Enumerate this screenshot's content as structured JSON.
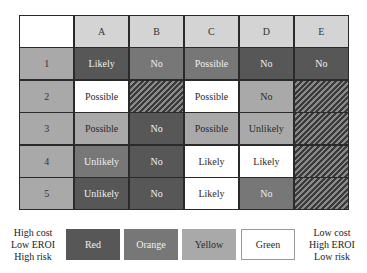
{
  "matrix": {
    "column_headers": [
      "A",
      "B",
      "C",
      "D",
      "E"
    ],
    "rows": [
      {
        "label": "1",
        "cells": [
          {
            "text": "Likely",
            "color": "red"
          },
          {
            "text": "No",
            "color": "orange"
          },
          {
            "text": "Possible",
            "color": "orange"
          },
          {
            "text": "No",
            "color": "red"
          },
          {
            "text": "No",
            "color": "red"
          }
        ]
      },
      {
        "label": "2",
        "cells": [
          {
            "text": "Possible",
            "color": "green"
          },
          {
            "text": "",
            "color": "hatched"
          },
          {
            "text": "Possible",
            "color": "green"
          },
          {
            "text": "No",
            "color": "yellow"
          },
          {
            "text": "",
            "color": "hatched"
          }
        ]
      },
      {
        "label": "3",
        "cells": [
          {
            "text": "Possible",
            "color": "yellow"
          },
          {
            "text": "No",
            "color": "red"
          },
          {
            "text": "Possible",
            "color": "yellow"
          },
          {
            "text": "Unlikely",
            "color": "yellow"
          },
          {
            "text": "",
            "color": "hatched"
          }
        ]
      },
      {
        "label": "4",
        "cells": [
          {
            "text": "Unlikely",
            "color": "orange"
          },
          {
            "text": "No",
            "color": "red"
          },
          {
            "text": "Likely",
            "color": "green"
          },
          {
            "text": "Likely",
            "color": "green"
          },
          {
            "text": "",
            "color": "hatched"
          }
        ]
      },
      {
        "label": "5",
        "cells": [
          {
            "text": "Unlikely",
            "color": "red"
          },
          {
            "text": "No",
            "color": "red"
          },
          {
            "text": "Likely",
            "color": "green"
          },
          {
            "text": "No",
            "color": "orange"
          },
          {
            "text": "",
            "color": "hatched"
          }
        ]
      }
    ]
  },
  "legend": {
    "left_label": [
      "High cost",
      "Low EROI",
      "High risk"
    ],
    "right_label": [
      "Low cost",
      "High EROI",
      "Low risk"
    ],
    "items": [
      {
        "label": "Red",
        "color": "red",
        "hex": "#575757"
      },
      {
        "label": "Orange",
        "color": "orange",
        "hex": "#777777"
      },
      {
        "label": "Yellow",
        "color": "yellow",
        "hex": "#a9a9a9"
      },
      {
        "label": "Green",
        "color": "green",
        "hex": "#ffffff"
      }
    ]
  },
  "colors": {
    "header": "#d4d4d4",
    "row_label": "#a9a9a9",
    "border": "#2a2a2a"
  }
}
